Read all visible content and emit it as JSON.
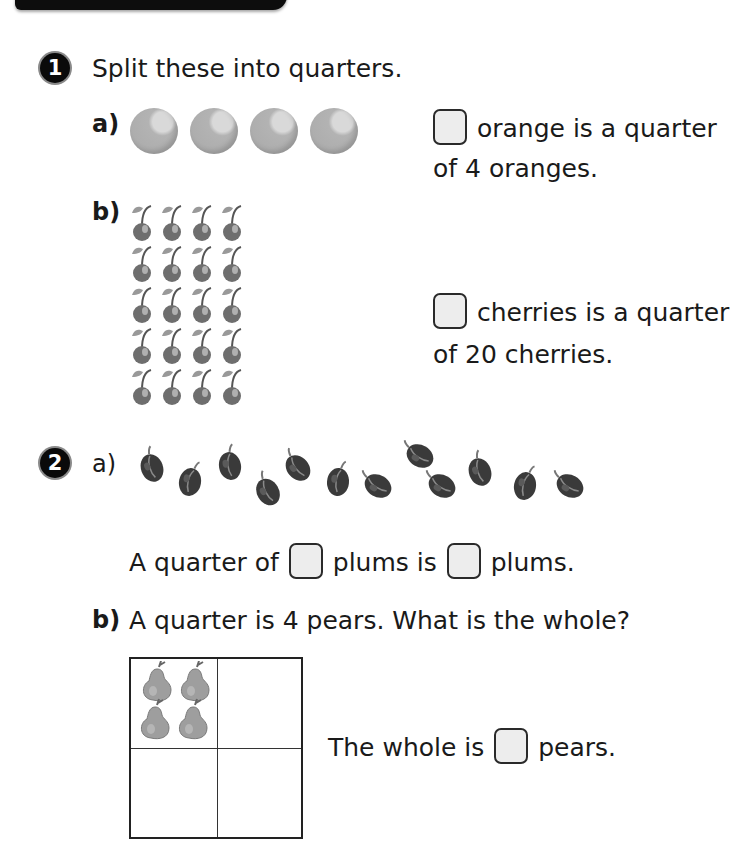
{
  "questions": [
    {
      "number": "1",
      "prompt": "Split these into quarters.",
      "parts": [
        {
          "label": "a)",
          "items": {
            "type": "orange",
            "count": 4
          },
          "sentence_line1_after_box": "orange is a quarter",
          "sentence_line2": "of 4 oranges."
        },
        {
          "label": "b)",
          "items": {
            "type": "cherry",
            "count": 20,
            "rows": 5,
            "cols": 4
          },
          "sentence_line1_after_box": "cherries is a quarter",
          "sentence_line2": "of 20 cherries."
        }
      ]
    },
    {
      "number": "2",
      "parts": [
        {
          "label": "a)",
          "items": {
            "type": "plum",
            "count": 12
          },
          "sentence": {
            "before": "A quarter of",
            "middle": "plums is",
            "after": "plums."
          }
        },
        {
          "label": "b)",
          "prompt": "A quarter is 4 pears. What is the whole?",
          "grid": {
            "rows": 2,
            "cols": 2,
            "filled_cell_pears": 4
          },
          "sentence": {
            "before": "The whole is",
            "after": "pears."
          }
        }
      ]
    }
  ],
  "colors": {
    "badge": "#0a0a0a",
    "answer_box_fill": "#ededed",
    "answer_box_border": "#2a2a2a",
    "fruit_grey": "#a9a9a9",
    "plum_dark": "#3a3a3a"
  }
}
